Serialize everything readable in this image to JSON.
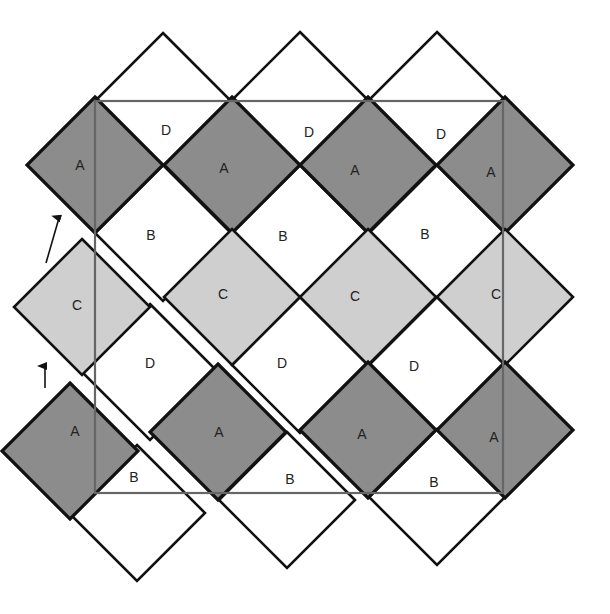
{
  "diagram": {
    "type": "tiling-proof",
    "colors": {
      "A": "#8c8c8c",
      "B": "#ffffff",
      "C": "#cfcfcf",
      "D": "#ffffff",
      "stroke": "#111111",
      "frame": "#666666",
      "background": "#ffffff"
    },
    "half_diagonal": 68,
    "frame": {
      "x1": 95,
      "y1": 101,
      "x2": 503,
      "y2": 493
    },
    "tiles": [
      {
        "label": "",
        "fill": "D",
        "cx": 163,
        "cy": 101,
        "show_label": false
      },
      {
        "label": "",
        "fill": "D",
        "cx": 300,
        "cy": 100,
        "show_label": false
      },
      {
        "label": "",
        "fill": "D",
        "cx": 437,
        "cy": 100,
        "show_label": false
      },
      {
        "label": "A",
        "fill": "A",
        "cx": 95,
        "cy": 165
      },
      {
        "label": "A",
        "fill": "A",
        "cx": 232,
        "cy": 165
      },
      {
        "label": "A",
        "fill": "A",
        "cx": 368,
        "cy": 165
      },
      {
        "label": "A",
        "fill": "A",
        "cx": 505,
        "cy": 165
      },
      {
        "label": "B",
        "fill": "B",
        "cx": 163,
        "cy": 233
      },
      {
        "label": "B",
        "fill": "B",
        "cx": 300,
        "cy": 233
      },
      {
        "label": "B",
        "fill": "B",
        "cx": 437,
        "cy": 233
      },
      {
        "label": "C",
        "fill": "C",
        "cx": 232,
        "cy": 297
      },
      {
        "label": "C",
        "fill": "C",
        "cx": 368,
        "cy": 297
      },
      {
        "label": "C",
        "fill": "C",
        "cx": 505,
        "cy": 297
      },
      {
        "label": "D",
        "fill": "D",
        "cx": 300,
        "cy": 365
      },
      {
        "label": "D",
        "fill": "D",
        "cx": 437,
        "cy": 365
      },
      {
        "label": "A",
        "fill": "A",
        "cx": 368,
        "cy": 430
      },
      {
        "label": "A",
        "fill": "A",
        "cx": 505,
        "cy": 430
      },
      {
        "label": "",
        "fill": "B",
        "cx": 437,
        "cy": 497,
        "show_label": false
      },
      {
        "label": "C",
        "fill": "C",
        "cx": 82,
        "cy": 307
      },
      {
        "label": "D",
        "fill": "D",
        "cx": 150,
        "cy": 372
      },
      {
        "label": "A",
        "fill": "A",
        "cx": 218,
        "cy": 432
      },
      {
        "label": "",
        "fill": "B",
        "cx": 287,
        "cy": 500,
        "show_label": false
      },
      {
        "label": "A",
        "fill": "A",
        "cx": 70,
        "cy": 451
      },
      {
        "label": "",
        "fill": "B",
        "cx": 137,
        "cy": 513,
        "show_label": false
      }
    ],
    "labels": [
      {
        "text": "D",
        "x": 166,
        "y": 131
      },
      {
        "text": "D",
        "x": 309,
        "y": 133
      },
      {
        "text": "D",
        "x": 441,
        "y": 135
      },
      {
        "text": "A",
        "x": 80,
        "y": 166
      },
      {
        "text": "A",
        "x": 224,
        "y": 169
      },
      {
        "text": "A",
        "x": 355,
        "y": 171
      },
      {
        "text": "A",
        "x": 491,
        "y": 173
      },
      {
        "text": "B",
        "x": 151,
        "y": 236
      },
      {
        "text": "B",
        "x": 283,
        "y": 237
      },
      {
        "text": "B",
        "x": 425,
        "y": 235
      },
      {
        "text": "C",
        "x": 77,
        "y": 306
      },
      {
        "text": "C",
        "x": 223,
        "y": 295
      },
      {
        "text": "C",
        "x": 355,
        "y": 297
      },
      {
        "text": "C",
        "x": 496,
        "y": 295
      },
      {
        "text": "D",
        "x": 150,
        "y": 364
      },
      {
        "text": "D",
        "x": 282,
        "y": 364
      },
      {
        "text": "D",
        "x": 414,
        "y": 367
      },
      {
        "text": "A",
        "x": 75,
        "y": 432
      },
      {
        "text": "A",
        "x": 219,
        "y": 433
      },
      {
        "text": "A",
        "x": 362,
        "y": 435
      },
      {
        "text": "A",
        "x": 494,
        "y": 438
      },
      {
        "text": "B",
        "x": 134,
        "y": 478
      },
      {
        "text": "B",
        "x": 290,
        "y": 480
      },
      {
        "text": "B",
        "x": 434,
        "y": 483
      }
    ],
    "arrows": [
      {
        "name": "arrow-diagonal",
        "x1": 46,
        "y1": 263,
        "x2": 59,
        "y2": 218
      },
      {
        "name": "arrow-up",
        "x1": 45,
        "y1": 388,
        "x2": 45,
        "y2": 366
      }
    ]
  }
}
